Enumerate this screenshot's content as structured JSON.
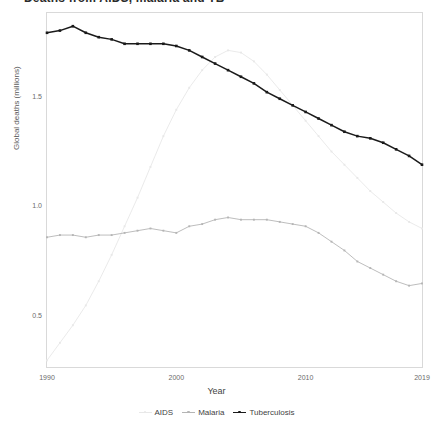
{
  "title": {
    "clipped_text": "Deaths from AIDS, malaria and TB"
  },
  "axes": {
    "y_label": "Global deaths (millions)",
    "x_label": "Year",
    "y_ticks": [
      "1.5",
      "1.0",
      "0.5"
    ],
    "x_ticks": [
      "1990",
      "2000",
      "2010",
      "2019"
    ]
  },
  "legend": {
    "items": [
      {
        "label": "AIDS",
        "color": "#e8e8e8"
      },
      {
        "label": "Malaria",
        "color": "#b5b5b5"
      },
      {
        "label": "Tuberculosis",
        "color": "#1a1a1a"
      }
    ]
  },
  "chart_data": {
    "type": "line",
    "title": "Deaths from AIDS, malaria and TB",
    "xlabel": "Year",
    "ylabel": "Global deaths (millions)",
    "xlim": [
      1990,
      2019
    ],
    "ylim": [
      0.27,
      1.88
    ],
    "y_ticks": [
      0.5,
      1.0,
      1.5
    ],
    "x_ticks": [
      1990,
      2000,
      2010,
      2019
    ],
    "grid": false,
    "legend_position": "bottom",
    "markers": true,
    "x": [
      1990,
      1991,
      1992,
      1993,
      1994,
      1995,
      1996,
      1997,
      1998,
      1999,
      2000,
      2001,
      2002,
      2003,
      2004,
      2005,
      2006,
      2007,
      2008,
      2009,
      2010,
      2011,
      2012,
      2013,
      2014,
      2015,
      2016,
      2017,
      2018,
      2019
    ],
    "series": [
      {
        "name": "AIDS",
        "color": "#e8e8e8",
        "values": [
          0.3,
          0.38,
          0.46,
          0.55,
          0.66,
          0.78,
          0.91,
          1.04,
          1.18,
          1.32,
          1.44,
          1.54,
          1.62,
          1.68,
          1.71,
          1.7,
          1.66,
          1.6,
          1.53,
          1.46,
          1.39,
          1.32,
          1.25,
          1.19,
          1.13,
          1.07,
          1.02,
          0.97,
          0.93,
          0.9
        ]
      },
      {
        "name": "Malaria",
        "color": "#b5b5b5",
        "values": [
          0.86,
          0.87,
          0.87,
          0.86,
          0.87,
          0.87,
          0.88,
          0.89,
          0.9,
          0.89,
          0.88,
          0.91,
          0.92,
          0.94,
          0.95,
          0.94,
          0.94,
          0.94,
          0.93,
          0.92,
          0.91,
          0.88,
          0.84,
          0.8,
          0.75,
          0.72,
          0.69,
          0.66,
          0.64,
          0.65
        ]
      },
      {
        "name": "Tuberculosis",
        "color": "#1a1a1a",
        "values": [
          1.79,
          1.8,
          1.82,
          1.79,
          1.77,
          1.76,
          1.74,
          1.74,
          1.74,
          1.74,
          1.73,
          1.71,
          1.68,
          1.65,
          1.62,
          1.59,
          1.56,
          1.52,
          1.49,
          1.46,
          1.43,
          1.4,
          1.37,
          1.34,
          1.32,
          1.31,
          1.29,
          1.26,
          1.23,
          1.19
        ]
      }
    ]
  }
}
